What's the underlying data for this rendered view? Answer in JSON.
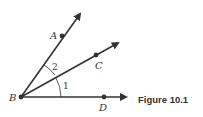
{
  "figure": {
    "caption": "Figure 10.1",
    "vertex": {
      "label": "B"
    },
    "points": [
      {
        "label": "A"
      },
      {
        "label": "C"
      },
      {
        "label": "D"
      }
    ],
    "angles": [
      {
        "label": "1",
        "between": "BC-BD"
      },
      {
        "label": "2",
        "between": "BA-BC"
      }
    ],
    "rays": [
      "BA",
      "BC",
      "BD"
    ],
    "colors": {
      "stroke": "#333333",
      "background": "#ffffff"
    }
  }
}
